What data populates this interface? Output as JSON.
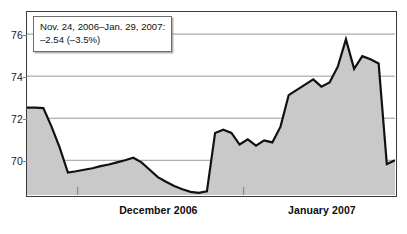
{
  "annotation": {
    "line1": "Nov. 24, 2006–Jan. 29, 2007:",
    "line2": "–2.54 (–3.5%)"
  },
  "axis": {
    "y_ticks": [
      76,
      74,
      72,
      70
    ],
    "y_tick_labels": [
      "76",
      "74",
      "72",
      "70"
    ],
    "x_labels": [
      "December 2006",
      "January 2007"
    ]
  },
  "colors": {
    "line": "#111111",
    "fill": "#c9c9c9",
    "grid": "#9a9a9a",
    "frame": "#3a3a3a",
    "background": "#ffffff",
    "annotation_border": "#6d6d6d"
  },
  "chart_data": {
    "type": "area",
    "title": "",
    "xlabel": "",
    "ylabel": "",
    "ylim": [
      68.35,
      77.05
    ],
    "xlim": [
      0,
      45
    ],
    "grid": true,
    "legend": null,
    "annotations": [
      {
        "text": "Nov. 24, 2006–Jan. 29, 2007: –2.54 (–3.5%)",
        "change_absolute": -2.54,
        "change_percent": -3.5,
        "start_date": "Nov. 24, 2006",
        "end_date": "Jan. 29, 2007"
      }
    ],
    "x_tick_positions": [
      6.2,
      26.5
    ],
    "x_tick_labels_positions": [
      16.0,
      36.0
    ],
    "categories": [
      "December 2006",
      "January 2007"
    ],
    "yticks": [
      70,
      72,
      74,
      76
    ],
    "series": [
      {
        "name": "Index",
        "x": [
          0,
          1,
          2,
          3,
          4,
          5,
          6,
          7,
          8,
          9,
          10,
          11,
          12,
          13,
          14,
          15,
          16,
          17,
          18,
          19,
          20,
          21,
          22,
          23,
          24,
          25,
          26,
          27,
          28,
          29,
          30,
          31,
          32,
          33,
          34,
          35,
          36,
          37,
          38,
          39,
          40,
          41,
          42,
          43,
          44,
          45
        ],
        "values": [
          72.5,
          72.5,
          72.48,
          71.6,
          70.6,
          69.42,
          69.48,
          69.55,
          69.62,
          69.72,
          69.8,
          69.9,
          70.0,
          70.12,
          69.9,
          69.55,
          69.2,
          68.98,
          68.78,
          68.62,
          68.5,
          68.45,
          68.52,
          71.3,
          71.45,
          71.3,
          70.75,
          71.0,
          70.7,
          70.95,
          70.85,
          71.6,
          73.1,
          73.35,
          73.6,
          73.85,
          73.5,
          73.7,
          74.45,
          75.75,
          74.35,
          74.95,
          74.8,
          74.6,
          69.82,
          70.0
        ]
      }
    ]
  }
}
